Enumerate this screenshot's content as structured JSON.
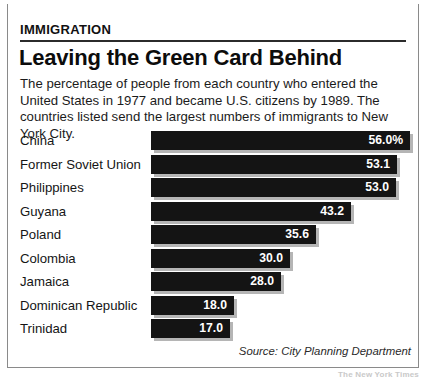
{
  "kicker": "IMMIGRATION",
  "headline": "Leaving the Green Card Behind",
  "deck": "The percentage of people from each country who entered the United States in 1977 and became U.S. citizens by 1989. The countries listed send the largest numbers of immigrants to New York City.",
  "source": "Source: City Planning Department",
  "credit": "The New York Times",
  "colors": {
    "bar": "#141414",
    "bar_shadow": "#787878",
    "value_text": "#ffffff",
    "top_rule": "#161616",
    "frame_border": "#8a8a8a",
    "background": "#ffffff"
  },
  "chart_data": {
    "type": "bar",
    "orientation": "horizontal",
    "title": "Leaving the Green Card Behind",
    "subtitle": "The percentage of people from each country who entered the United States in 1977 and became U.S. citizens by 1989. The countries listed send the largest numbers of immigrants to New York City.",
    "xlabel": "",
    "ylabel": "",
    "xlim": [
      0,
      56
    ],
    "grid": false,
    "legend": null,
    "unit": "percent",
    "categories": [
      "China",
      "Former Soviet Union",
      "Philippines",
      "Guyana",
      "Poland",
      "Colombia",
      "Jamaica",
      "Dominican Republic",
      "Trinidad"
    ],
    "values": [
      56.0,
      53.1,
      53.0,
      43.2,
      35.6,
      30.0,
      28.0,
      18.0,
      17.0
    ],
    "labels": [
      "56.0%",
      "53.1",
      "53.0",
      "43.2",
      "35.6",
      "30.0",
      "28.0",
      "18.0",
      "17.0"
    ]
  },
  "rows": [
    {
      "label": "China",
      "value": 56.0,
      "display": "56.0%"
    },
    {
      "label": "Former Soviet Union",
      "value": 53.1,
      "display": "53.1"
    },
    {
      "label": "Philippines",
      "value": 53.0,
      "display": "53.0"
    },
    {
      "label": "Guyana",
      "value": 43.2,
      "display": "43.2"
    },
    {
      "label": "Poland",
      "value": 35.6,
      "display": "35.6"
    },
    {
      "label": "Colombia",
      "value": 30.0,
      "display": "30.0"
    },
    {
      "label": "Jamaica",
      "value": 28.0,
      "display": "28.0"
    },
    {
      "label": "Dominican Republic",
      "value": 18.0,
      "display": "18.0"
    },
    {
      "label": "Trinidad",
      "value": 17.0,
      "display": "17.0"
    }
  ]
}
